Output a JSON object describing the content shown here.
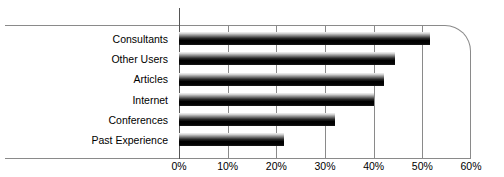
{
  "chart_data": {
    "type": "bar",
    "orientation": "horizontal",
    "title": "",
    "xlabel": "",
    "ylabel": "",
    "categories": [
      "Consultants",
      "Other Users",
      "Articles",
      "Internet",
      "Conferences",
      "Past Experience"
    ],
    "values": [
      51.5,
      44.3,
      42.2,
      40.0,
      32.0,
      21.5
    ],
    "value_format": "percent",
    "xlim": [
      0,
      60
    ],
    "xticks": [
      0,
      10,
      20,
      30,
      40,
      50,
      60
    ],
    "xtick_labels": [
      "0%",
      "10%",
      "20%",
      "30%",
      "40%",
      "50%",
      "60%"
    ],
    "grid": true,
    "grid_axis": "x",
    "legend": false,
    "legend_position": "none",
    "bar_fill": "vertical-gradient-light-to-black",
    "colors": {
      "bar_highlight": "#f2f2f2",
      "bar_shadow": "#000000",
      "gridline": "#8a8a8a",
      "axis": "#555555",
      "frame": "#8a8a8a",
      "text": "#000000",
      "background": "#ffffff"
    }
  }
}
